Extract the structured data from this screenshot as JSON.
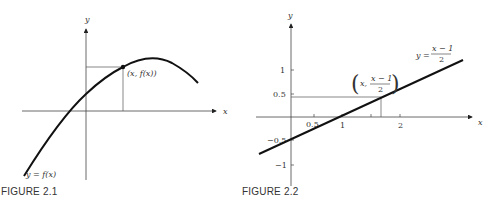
{
  "figures": [
    {
      "caption": "FIGURE 2.1",
      "x_axis_label": "x",
      "y_axis_label": "y",
      "point_label": "(x, f(x))",
      "curve_label": "y = f(x)"
    },
    {
      "caption": "FIGURE 2.2",
      "x_axis_label": "x",
      "y_axis_label": "y",
      "line_label_prefix": "y =",
      "line_label_numerator": "x − 1",
      "line_label_denominator": "2",
      "point_label_x": "x,",
      "point_label_numerator": "x − 1",
      "point_label_denominator": "2",
      "x_ticks": [
        "0.5",
        "1",
        "2"
      ],
      "y_ticks": [
        "1",
        "0.5",
        "−0.5",
        "−1"
      ]
    }
  ],
  "colors": {
    "ink": "#222222",
    "background": "#ffffff"
  }
}
